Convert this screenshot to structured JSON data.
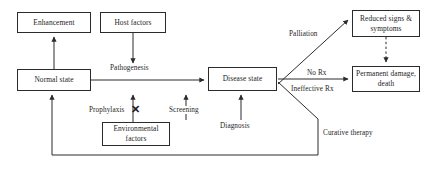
{
  "diagram": {
    "canvas": {
      "width": 436,
      "height": 174,
      "background": "#ffffff"
    },
    "line_color": "#2b2b2b",
    "text_color": "#1d1d1d",
    "nodes": [
      {
        "id": "enhancement",
        "label": "Enhancement",
        "x": 17,
        "y": 12,
        "w": 74,
        "h": 21
      },
      {
        "id": "host-factors",
        "label": "Host factors",
        "x": 100,
        "y": 12,
        "w": 66,
        "h": 21
      },
      {
        "id": "normal-state",
        "label": "Normal state",
        "x": 17,
        "y": 69,
        "w": 74,
        "h": 22
      },
      {
        "id": "disease-state",
        "label": "Disease state",
        "x": 208,
        "y": 67,
        "w": 69,
        "h": 24
      },
      {
        "id": "reduced-signs",
        "label": "Reduced signs & symptoms",
        "x": 352,
        "y": 10,
        "w": 68,
        "h": 27
      },
      {
        "id": "permanent-damage",
        "label": "Permanent damage, death",
        "x": 352,
        "y": 66,
        "w": 68,
        "h": 26
      },
      {
        "id": "environmental-factors",
        "label": "Environmental factors",
        "x": 102,
        "y": 122,
        "w": 68,
        "h": 24
      }
    ],
    "edge_labels": [
      {
        "id": "pathogenesis",
        "text": "Pathogenesis",
        "x": 109,
        "y": 64
      },
      {
        "id": "prophylaxis",
        "text": "Prophylaxis",
        "x": 88,
        "y": 106
      },
      {
        "id": "screening",
        "text": "Screening",
        "x": 168,
        "y": 106
      },
      {
        "id": "diagnosis",
        "text": "Diagnosis",
        "x": 219,
        "y": 122
      },
      {
        "id": "palliation",
        "text": "Palliation",
        "x": 288,
        "y": 30
      },
      {
        "id": "no-rx",
        "text": "No Rx",
        "x": 306,
        "y": 69
      },
      {
        "id": "ineffective-rx",
        "text": "Ineffective Rx",
        "x": 290,
        "y": 85
      },
      {
        "id": "curative-therapy",
        "text": "Curative therapy",
        "x": 322,
        "y": 129
      }
    ],
    "blocked_marker": {
      "id": "prophylaxis-blocked",
      "symbol": "✕",
      "x": 131,
      "y": 104
    }
  }
}
